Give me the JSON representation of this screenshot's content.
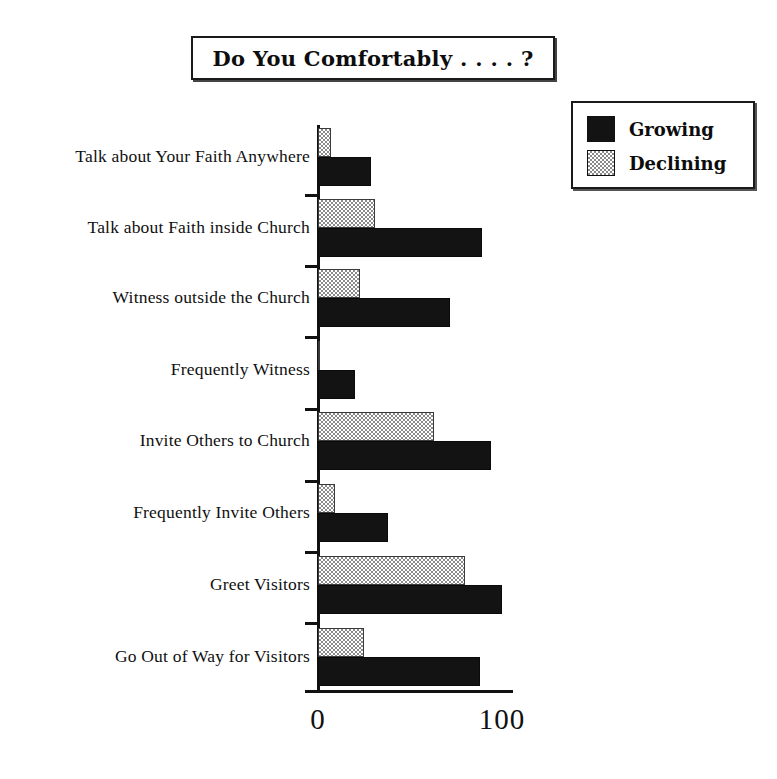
{
  "title": {
    "text": "Do You Comfortably . . . . ?"
  },
  "legend": {
    "position": "top-right",
    "entries": [
      {
        "label": "Growing",
        "swatch": "black-solid-swatch",
        "color": "#131313"
      },
      {
        "label": "Declining",
        "swatch": "gray-hatched-swatch",
        "color": "#8c8c8c"
      }
    ]
  },
  "axis": {
    "x_ticks": [
      "0",
      "100"
    ],
    "x_min": 0,
    "x_max": 100
  },
  "chart_data": {
    "type": "bar",
    "orientation": "horizontal",
    "title": "Do You Comfortably . . . . ?",
    "xlabel": "",
    "ylabel": "",
    "xlim": [
      0,
      100
    ],
    "grid": false,
    "legend_position": "top-right",
    "tick_labels": [
      "0",
      "100"
    ],
    "categories": [
      "Talk about Your Faith Anywhere",
      "Talk about Faith inside Church",
      "Witness outside the Church",
      "Frequently Witness",
      "Invite Others to Church",
      "Frequently Invite Others",
      "Greet  Visitors",
      "Go Out of Way for Visitors"
    ],
    "series": [
      {
        "name": "Declining",
        "color": "#8c8c8c",
        "values": [
          7,
          31,
          23,
          1,
          63,
          9,
          80,
          25
        ]
      },
      {
        "name": "Growing",
        "color": "#131313",
        "values": [
          29,
          89,
          72,
          20,
          94,
          38,
          100,
          88
        ]
      }
    ]
  },
  "geometry": {
    "axis_x_px": 318,
    "axis_zero_px": 318,
    "axis_hundred_px": 502,
    "plot_top_px": 125,
    "group_height_px": 70,
    "bar_height_px": 29,
    "groups": [
      {
        "top": 128,
        "tick": 194
      },
      {
        "top": 199,
        "tick": 265
      },
      {
        "top": 269,
        "tick": 336
      },
      {
        "top": 341,
        "tick": 408
      },
      {
        "top": 412,
        "tick": 480
      },
      {
        "top": 484,
        "tick": 551
      },
      {
        "top": 556,
        "tick": 622
      },
      {
        "top": 628,
        "tick": 690
      }
    ]
  }
}
